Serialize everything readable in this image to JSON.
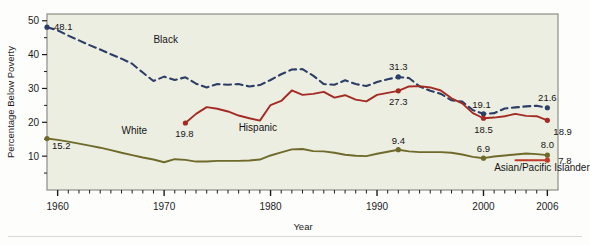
{
  "figure": {
    "background": "#fdfdfb",
    "plot_background": "#edeee2",
    "frame_color": "#8e8e86"
  },
  "chart_data": {
    "type": "line",
    "title": "",
    "xlabel": "Year",
    "ylabel": "Percentage Below Poverty",
    "xlim": [
      1959,
      2007
    ],
    "ylim": [
      0,
      52
    ],
    "yticks": [
      10,
      20,
      30,
      40,
      50
    ],
    "ytick_labels": [
      "10",
      "20",
      "30",
      "40",
      "50"
    ],
    "xticks": [
      1960,
      1970,
      1980,
      1990,
      2000,
      2006
    ],
    "xtick_labels": [
      "1960",
      "1970",
      "1980",
      "1990",
      "2000",
      "2006"
    ],
    "minor_xtick_interval": 1,
    "grid": false,
    "legend_position": "inline-annotations",
    "series": [
      {
        "name": "Black",
        "label": "Black",
        "color": "#2c3e66",
        "style": "dashed",
        "x": [
          1959,
          1960,
          1961,
          1962,
          1963,
          1964,
          1965,
          1966,
          1967,
          1968,
          1969,
          1970,
          1971,
          1972,
          1973,
          1974,
          1975,
          1976,
          1977,
          1978,
          1979,
          1980,
          1981,
          1982,
          1983,
          1984,
          1985,
          1986,
          1987,
          1988,
          1989,
          1990,
          1991,
          1992,
          1993,
          1994,
          1995,
          1996,
          1997,
          1998,
          1999,
          2000,
          2001,
          2002,
          2003,
          2004,
          2005,
          2006
        ],
        "values": [
          48.1,
          47.2,
          45.6,
          44.2,
          42.8,
          41.5,
          40.1,
          38.8,
          37.3,
          34.7,
          32.2,
          33.5,
          32.5,
          33.3,
          31.4,
          30.3,
          31.3,
          31.1,
          31.3,
          30.6,
          31.0,
          32.5,
          34.2,
          35.6,
          35.7,
          33.8,
          31.3,
          31.1,
          32.4,
          31.3,
          30.7,
          31.9,
          32.7,
          33.4,
          33.1,
          30.6,
          29.3,
          28.4,
          26.5,
          26.1,
          23.6,
          22.5,
          22.7,
          24.1,
          24.4,
          24.7,
          24.9,
          24.3
        ],
        "labeled_points": [
          {
            "x": 1959,
            "value": 48.1,
            "label": "48.1"
          },
          {
            "x": 1992,
            "value": 33.4,
            "label": "31.3"
          },
          {
            "x": 2000,
            "value": 22.5,
            "label": "19.1"
          },
          {
            "x": 2006,
            "value": 24.3,
            "label": "21.6"
          }
        ],
        "markers_at": [
          1959,
          1992,
          2000,
          2006
        ]
      },
      {
        "name": "Hispanic",
        "label": "Hispanic",
        "color": "#a32b24",
        "style": "solid",
        "x": [
          1972,
          1973,
          1974,
          1975,
          1976,
          1977,
          1978,
          1979,
          1980,
          1981,
          1982,
          1983,
          1984,
          1985,
          1986,
          1987,
          1988,
          1989,
          1990,
          1991,
          1992,
          1993,
          1994,
          1995,
          1996,
          1997,
          1998,
          1999,
          2000,
          2001,
          2002,
          2003,
          2004,
          2005,
          2006
        ],
        "values": [
          19.8,
          22.5,
          24.5,
          24.0,
          23.2,
          22.0,
          21.2,
          20.5,
          25.1,
          26.3,
          29.4,
          28.1,
          28.4,
          29.0,
          27.3,
          28.0,
          26.7,
          26.2,
          28.1,
          28.7,
          29.3,
          30.6,
          30.7,
          30.3,
          29.4,
          27.1,
          25.6,
          22.7,
          21.2,
          21.4,
          21.8,
          22.5,
          21.9,
          21.8,
          20.6
        ],
        "labeled_points": [
          {
            "x": 1972,
            "value": 19.8,
            "label": "19.8"
          },
          {
            "x": 1992,
            "value": 29.3,
            "label": "27.3"
          },
          {
            "x": 2000,
            "value": 21.2,
            "label": "18.5"
          },
          {
            "x": 2006,
            "value": 20.6,
            "label": "18.9"
          }
        ],
        "markers_at": [
          1972,
          1992,
          2000,
          2006
        ]
      },
      {
        "name": "White",
        "label": "White",
        "color": "#6f6a2a",
        "style": "solid",
        "x": [
          1959,
          1960,
          1961,
          1962,
          1963,
          1964,
          1965,
          1966,
          1967,
          1968,
          1969,
          1970,
          1971,
          1972,
          1973,
          1974,
          1975,
          1976,
          1977,
          1978,
          1979,
          1980,
          1981,
          1982,
          1983,
          1984,
          1985,
          1986,
          1987,
          1988,
          1989,
          1990,
          1991,
          1992,
          1993,
          1994,
          1995,
          1996,
          1997,
          1998,
          1999,
          2000,
          2001,
          2002,
          2003,
          2004,
          2005,
          2006
        ],
        "values": [
          15.2,
          14.8,
          14.3,
          13.7,
          13.1,
          12.5,
          11.8,
          11.0,
          10.3,
          9.6,
          9.0,
          8.2,
          9.1,
          8.9,
          8.4,
          8.4,
          8.6,
          8.6,
          8.6,
          8.7,
          9.0,
          10.2,
          11.1,
          12.0,
          12.1,
          11.5,
          11.4,
          11.0,
          10.4,
          10.1,
          10.0,
          10.7,
          11.3,
          11.9,
          11.4,
          11.2,
          11.2,
          11.2,
          11.0,
          10.5,
          9.8,
          9.4,
          9.9,
          10.2,
          10.5,
          10.8,
          10.6,
          10.3
        ],
        "labeled_points": [
          {
            "x": 1959,
            "value": 15.2,
            "label": "15.2"
          },
          {
            "x": 1992,
            "value": 11.9,
            "label": "9.4"
          },
          {
            "x": 2000,
            "value": 9.4,
            "label": "6.9"
          },
          {
            "x": 2006,
            "value": 10.3,
            "label": "8.0"
          }
        ],
        "markers_at": [
          1959,
          1992,
          2000,
          2006
        ]
      },
      {
        "name": "Asian/Pacific Islander",
        "label": "Asian/Pacific Islander",
        "color": "#c0392b",
        "style": "solid",
        "x": [
          2003,
          2006
        ],
        "values": [
          8.8,
          8.8
        ],
        "labeled_points": [
          {
            "x": 2006,
            "value": 8.8,
            "label": "7.8"
          }
        ],
        "markers_at": [
          2006
        ]
      }
    ],
    "annotations": [
      {
        "text": "Black",
        "x": 1969,
        "y": 43.5
      },
      {
        "text": "White",
        "x": 1966,
        "y": 16.5
      },
      {
        "text": "Hispanic",
        "x": 1977,
        "y": 17.5
      },
      {
        "text": "Asian/Pacific Islander",
        "x": 2001,
        "y": 5.6
      }
    ]
  }
}
